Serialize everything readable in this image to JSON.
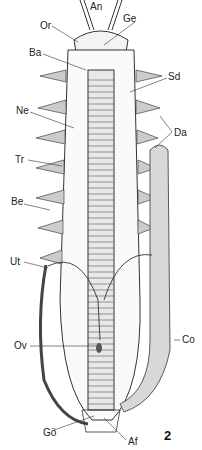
{
  "figure": {
    "number": "2",
    "labels": [
      {
        "id": "An",
        "text": "An",
        "x": 90,
        "y": 2
      },
      {
        "id": "Or",
        "text": "Or",
        "x": 40,
        "y": 21
      },
      {
        "id": "Ge",
        "text": "Ge",
        "x": 123,
        "y": 14
      },
      {
        "id": "Ba",
        "text": "Ba",
        "x": 29,
        "y": 48
      },
      {
        "id": "Sd",
        "text": "Sd",
        "x": 168,
        "y": 72
      },
      {
        "id": "Ne",
        "text": "Ne",
        "x": 16,
        "y": 106
      },
      {
        "id": "Da",
        "text": "Da",
        "x": 174,
        "y": 128
      },
      {
        "id": "Tr",
        "text": "Tr",
        "x": 15,
        "y": 155
      },
      {
        "id": "Be",
        "text": "Be",
        "x": 11,
        "y": 197
      },
      {
        "id": "Ut",
        "text": "Ut",
        "x": 10,
        "y": 257
      },
      {
        "id": "Ov",
        "text": "Ov",
        "x": 14,
        "y": 341
      },
      {
        "id": "Co",
        "text": "Co",
        "x": 182,
        "y": 335
      },
      {
        "id": "Go",
        "text": "Gö",
        "x": 43,
        "y": 428
      },
      {
        "id": "Af",
        "text": "Af",
        "x": 128,
        "y": 437
      }
    ]
  }
}
